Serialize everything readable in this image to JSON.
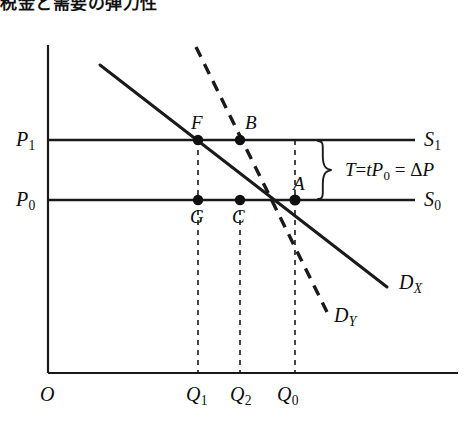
{
  "title": "税金と需要の弾力性",
  "figure": {
    "origin_label": "O",
    "y_axis_ticks": [
      {
        "name": "P1",
        "text": "P",
        "sub": "1"
      },
      {
        "name": "P0",
        "text": "P",
        "sub": "0"
      }
    ],
    "x_axis_ticks": [
      {
        "name": "Q1",
        "text": "Q",
        "sub": "1"
      },
      {
        "name": "Q2",
        "text": "Q",
        "sub": "2"
      },
      {
        "name": "Q0",
        "text": "Q",
        "sub": "0"
      }
    ],
    "supply_curves": [
      {
        "name": "S1",
        "text": "S",
        "sub": "1"
      },
      {
        "name": "S0",
        "text": "S",
        "sub": "0"
      }
    ],
    "demand_curves": [
      {
        "name": "DX",
        "text": "D",
        "sub": "X",
        "style": "solid"
      },
      {
        "name": "DY",
        "text": "D",
        "sub": "Y",
        "style": "dashed"
      }
    ],
    "points": [
      {
        "name": "F",
        "label": "F"
      },
      {
        "name": "B",
        "label": "B"
      },
      {
        "name": "A",
        "label": "A"
      },
      {
        "name": "G",
        "label": "G"
      },
      {
        "name": "C",
        "label": "C"
      }
    ],
    "tax_annotation": {
      "prefix": "T",
      "eq1": "=",
      "term1": "t",
      "term1_sub": "P",
      "term1_sub_idx": "0",
      "eq2": "=",
      "delta": "Δ",
      "term2": "P",
      "full": "T = tP0 = ΔP"
    },
    "colors": {
      "line": "#1a1a1a",
      "text": "#0d0d0d",
      "background": "#ffffff"
    }
  }
}
